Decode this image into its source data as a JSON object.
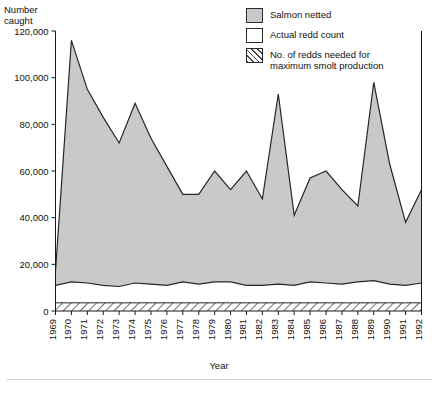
{
  "chart_data": {
    "type": "area",
    "title": "",
    "xlabel": "Year",
    "ylabel": "Number\ncaught",
    "ylabel_line1": "Number",
    "ylabel_line2": "caught",
    "ylim": [
      0,
      120000
    ],
    "ytick_values": [
      0,
      20000,
      40000,
      60000,
      80000,
      100000,
      120000
    ],
    "ytick_labels": [
      "0",
      "20,000",
      "40,000",
      "60,000",
      "80,000",
      "100,000",
      "120,000"
    ],
    "grid": false,
    "legend_position": "top-right",
    "categories": [
      "1969",
      "1970",
      "1971",
      "1972",
      "1973",
      "1974",
      "1975",
      "1976",
      "1977",
      "1978",
      "1979",
      "1980",
      "1981",
      "1982",
      "1983",
      "1984",
      "1985",
      "1986",
      "1987",
      "1988",
      "1989",
      "1990",
      "1991",
      "1992"
    ],
    "series": [
      {
        "name": "Salmon netted",
        "fill": "#c9c9c9",
        "values": [
          17000,
          116000,
          95000,
          83000,
          72000,
          89000,
          74000,
          62000,
          50000,
          50000,
          60000,
          52000,
          60000,
          48000,
          93000,
          41000,
          57000,
          60000,
          52000,
          45000,
          98000,
          63000,
          38000,
          52000
        ]
      },
      {
        "name": "Actual redd count",
        "fill": "#ffffff",
        "values": [
          11000,
          12500,
          12000,
          11000,
          10500,
          12000,
          11500,
          11000,
          12500,
          11500,
          12500,
          12500,
          11000,
          11000,
          11500,
          11000,
          12500,
          12000,
          11500,
          12500,
          13000,
          11500,
          11000,
          12000
        ]
      },
      {
        "name": "No. of redds needed for maximum smolt production",
        "fill": "hatched",
        "values": [
          3500,
          3500,
          3500,
          3500,
          3500,
          3500,
          3500,
          3500,
          3500,
          3500,
          3500,
          3500,
          3500,
          3500,
          3500,
          3500,
          3500,
          3500,
          3500,
          3500,
          3500,
          3500,
          3500,
          3500
        ]
      }
    ],
    "legend": [
      {
        "label": "Salmon netted",
        "swatch": "solid-gray"
      },
      {
        "label": "Actual redd count",
        "swatch": "white"
      },
      {
        "label": "No. of redds needed for\nmaximum smolt production",
        "swatch": "hatched"
      }
    ],
    "colors": {
      "salmon_fill": "#c9c9c9",
      "redd_fill": "#ffffff",
      "hatch_line": "#4a4a4a",
      "axis": "#1a1a1a",
      "line": "#262626"
    }
  }
}
